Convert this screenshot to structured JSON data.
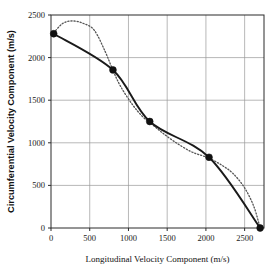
{
  "chart_data": {
    "type": "line",
    "title": "",
    "subtitle": "",
    "xlabel": "Longitudinal Velocity Component (m/s)",
    "ylabel": "Circumferential Velocity Component (m/s)",
    "xlim": [
      0,
      2750
    ],
    "ylim": [
      0,
      2500
    ],
    "xticks": [
      0,
      500,
      1000,
      1500,
      2000,
      2500
    ],
    "yticks": [
      0,
      500,
      1000,
      1500,
      2000,
      2500
    ],
    "xticklabels": [
      "0",
      "500",
      "1000",
      "1500",
      "2000",
      "2500"
    ],
    "yticklabels": [
      "0",
      "500",
      "1000",
      "1500",
      "2000",
      "2500"
    ],
    "grid": true,
    "legend": false,
    "legend_position": "none",
    "marker_color": "#111111",
    "solid_color": "#1a1a1a",
    "dotted_color": "#555555",
    "series": [
      {
        "name": "measured",
        "style": "solid",
        "marker": "filled-circle",
        "x": [
          35,
          800,
          1275,
          2040,
          2700
        ],
        "y": [
          2280,
          1855,
          1250,
          830,
          0
        ]
      },
      {
        "name": "model",
        "style": "dotted",
        "marker": "none",
        "x": [
          35,
          150,
          280,
          420,
          560,
          700,
          800,
          900,
          1050,
          1180,
          1275,
          1420,
          1600,
          1800,
          1950,
          2040,
          2200,
          2350,
          2500,
          2620,
          2700
        ],
        "y": [
          2290,
          2400,
          2430,
          2400,
          2320,
          2070,
          1850,
          1660,
          1450,
          1310,
          1240,
          1130,
          1010,
          900,
          850,
          820,
          740,
          640,
          470,
          250,
          0
        ]
      }
    ]
  },
  "axis": {
    "x_title": "Longitudinal Velocity Component (m/s)",
    "y_title": "Circumferential Velocity Component (m/s)"
  }
}
